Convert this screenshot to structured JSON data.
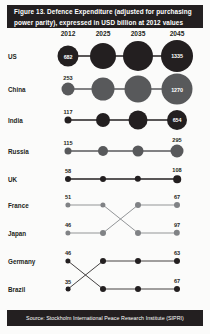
{
  "figure": {
    "title": "Figure 13. Defence Expenditure (adjusted for purchasing power parity), expressed in USD billion at 2012 values",
    "source": "Source: Stockholm International Peace Research Institute (SIPRI)"
  },
  "chart_data": {
    "type": "bump",
    "title": "Figure 13. Defence Expenditure (adjusted for purchasing power parity), expressed in USD billion at 2012 values",
    "subtitle": "",
    "xlabel": "",
    "ylabel": "",
    "grid": false,
    "legend": "none",
    "categories": [
      "2012",
      "2025",
      "2035",
      "2045"
    ],
    "rank_axis_labels": [
      "US",
      "China",
      "India",
      "Russia",
      "UK",
      "France",
      "Japan",
      "Germany",
      "Brazil"
    ],
    "annotations": [
      "Bubble area is proportional to defence expenditure",
      "Value labels shown for 2012 and 2045 only"
    ],
    "series": [
      {
        "name": "US",
        "color": "#231f20",
        "values": [
          682,
          980,
          1180,
          1335
        ],
        "ranks": [
          1,
          1,
          1,
          1
        ],
        "start_label": "682",
        "end_label": "1335"
      },
      {
        "name": "China",
        "color": "#58595b",
        "values": [
          253,
          760,
          980,
          1270
        ],
        "ranks": [
          2,
          2,
          2,
          2
        ],
        "start_label": "253",
        "end_label": "1270"
      },
      {
        "name": "India",
        "color": "#231f20",
        "values": [
          117,
          380,
          570,
          654
        ],
        "ranks": [
          3,
          3,
          3,
          3
        ],
        "start_label": "117",
        "end_label": "654"
      },
      {
        "name": "Russia",
        "color": "#58595b",
        "values": [
          115,
          210,
          250,
          295
        ],
        "ranks": [
          4,
          4,
          4,
          4
        ],
        "start_label": "115",
        "end_label": "295"
      },
      {
        "name": "UK",
        "color": "#231f20",
        "values": [
          58,
          78,
          92,
          108
        ],
        "ranks": [
          5,
          5,
          5,
          5
        ],
        "start_label": "58",
        "end_label": "108"
      },
      {
        "name": "France",
        "color": "#808285",
        "values": [
          51,
          58,
          85,
          97
        ],
        "ranks": [
          6,
          6,
          7,
          7
        ],
        "start_label": "51",
        "end_label": "97"
      },
      {
        "name": "Japan",
        "color": "#808285",
        "values": [
          46,
          52,
          62,
          67
        ],
        "ranks": [
          7,
          7,
          6,
          6
        ],
        "start_label": "46",
        "end_label": "67"
      },
      {
        "name": "Germany",
        "color": "#231f20",
        "values": [
          46,
          50,
          60,
          67
        ],
        "ranks": [
          8,
          9,
          9,
          9
        ],
        "start_label": "46",
        "end_label": "67"
      },
      {
        "name": "Brazil",
        "color": "#231f20",
        "values": [
          35,
          48,
          56,
          63
        ],
        "ranks": [
          9,
          8,
          8,
          8
        ],
        "start_label": "35",
        "end_label": "63"
      }
    ]
  },
  "layout": {
    "col_x": [
      68,
      103,
      138,
      177
    ],
    "row_y": [
      13,
      46,
      77,
      108,
      136,
      162,
      190,
      218,
      246
    ],
    "node_radius_px": [
      [
        10.5,
        13.0,
        15.0,
        16.0
      ],
      [
        6.5,
        11.5,
        13.5,
        15.5
      ],
      [
        3.5,
        7.0,
        9.5,
        10.0
      ],
      [
        3.5,
        5.0,
        5.5,
        6.5
      ],
      [
        3.0,
        3.0,
        3.2,
        3.8
      ],
      [
        2.6,
        2.6,
        3.0,
        3.2
      ],
      [
        2.6,
        3.0,
        3.0,
        3.0
      ],
      [
        2.6,
        3.0,
        3.0,
        3.0
      ],
      [
        2.4,
        3.0,
        3.0,
        3.0
      ]
    ]
  }
}
